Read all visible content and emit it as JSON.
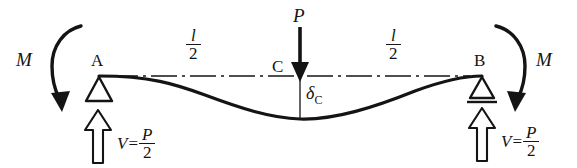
{
  "figure": {
    "background_color": "#ffffff",
    "ink_color": "#141414"
  },
  "labels": {
    "moment_left": "M",
    "moment_right": "M",
    "support_left": "A",
    "support_right": "B",
    "midpoint": "C",
    "load": "P",
    "deflection_symbol": "δ",
    "deflection_subscript": "C",
    "span_half_numerator": "l",
    "span_half_denominator": "2",
    "reaction_symbol": "V",
    "reaction_equals": "=",
    "reaction_numerator": "P",
    "reaction_denominator": "2"
  },
  "dimensions": {
    "left_span_label_numerator": "l",
    "left_span_label_denominator": "2",
    "right_span_label_numerator": "l",
    "right_span_label_denominator": "2"
  },
  "reactions": {
    "left": {
      "symbol": "V",
      "equals": "=",
      "numerator": "P",
      "denominator": "2"
    },
    "right": {
      "symbol": "V",
      "equals": "=",
      "numerator": "P",
      "denominator": "2"
    }
  },
  "icons": {
    "load_arrow": "down-arrow-solid-icon",
    "reaction_arrow_left": "up-arrow-outline-icon",
    "reaction_arrow_right": "up-arrow-outline-icon",
    "moment_arrow_left": "curved-moment-arrow-icon",
    "moment_arrow_right": "curved-moment-arrow-icon",
    "support_left": "pin-support-triangle-icon",
    "support_right": "roller-support-triangle-icon",
    "centerline": "dash-dot-centerline-icon",
    "beam_curve": "deflected-beam-curve-icon",
    "deflection_tick": "deflection-measure-line-icon"
  },
  "geometry": {
    "baseline_y": 76,
    "support_left_x": 98,
    "support_right_x": 482,
    "midspan_x": 300,
    "max_deflection_y": 119
  }
}
